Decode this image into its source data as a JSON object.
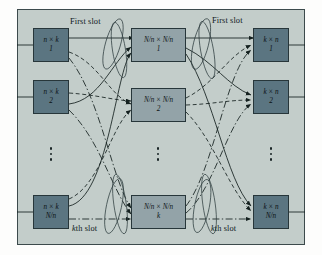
{
  "figure": {
    "background_color": "#c3cdca",
    "border_color": "#3c4a4c",
    "input_stage_color": "#5b7581",
    "middle_stage_color": "#93a3a8",
    "output_stage_color": "#5b7581"
  },
  "stages": {
    "input": {
      "name": "input-stage",
      "nodes": [
        {
          "dimension": "n × k",
          "index": "1"
        },
        {
          "dimension": "n × k",
          "index": "2"
        },
        {
          "dimension": "n × k",
          "index": "N/n"
        }
      ],
      "ellipsis": "⋮"
    },
    "middle": {
      "name": "middle-stage",
      "nodes": [
        {
          "dimension": "N/n × N/n",
          "index": "1"
        },
        {
          "dimension": "N/n × N/n",
          "index": "2"
        },
        {
          "dimension": "N/n × N/n",
          "index": "k"
        }
      ],
      "ellipsis": "⋮"
    },
    "output": {
      "name": "output-stage",
      "nodes": [
        {
          "dimension": "k × n",
          "index": "1"
        },
        {
          "dimension": "k × n",
          "index": "2"
        },
        {
          "dimension": "k × n",
          "index": "N/n"
        }
      ],
      "ellipsis": "⋮"
    }
  },
  "labels": {
    "first_slot_left": "First slot",
    "first_slot_right": "First slot",
    "kth_slot_left_prefix": "k",
    "kth_slot_left_suffix": "th slot",
    "kth_slot_right_prefix": "k",
    "kth_slot_right_suffix": "th slot"
  }
}
